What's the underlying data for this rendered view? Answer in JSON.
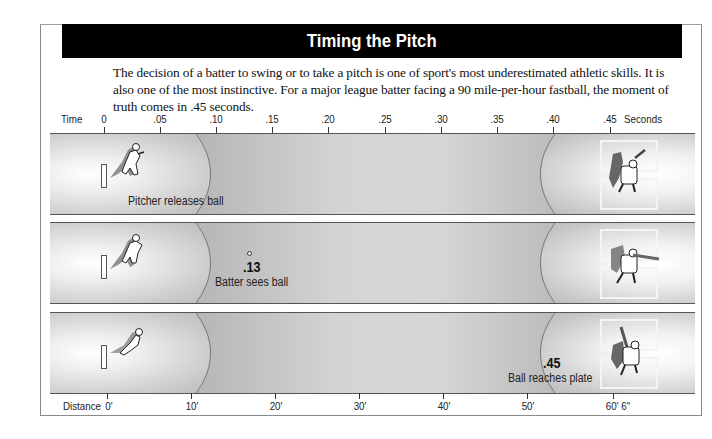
{
  "title": "Timing the Pitch",
  "intro": "The decision of a batter to swing or to take a pitch is one of sport's most underestimated athletic skills. It is also one of the most instinctive. For a major league batter facing a 90 mile-per-hour fastball, the moment of truth comes in .45 seconds.",
  "time_axis": {
    "label": "Time",
    "unit_label": "Seconds",
    "ticks": [
      {
        "label": "0",
        "x": 104
      },
      {
        "label": ".05",
        "x": 160
      },
      {
        "label": ".10",
        "x": 216
      },
      {
        "label": ".15",
        "x": 272
      },
      {
        "label": ".20",
        "x": 328
      },
      {
        "label": ".25",
        "x": 385
      },
      {
        "label": ".30",
        "x": 441
      },
      {
        "label": ".35",
        "x": 497
      },
      {
        "label": ".40",
        "x": 553
      },
      {
        "label": ".45",
        "x": 610
      }
    ]
  },
  "distance_axis": {
    "label": "Distance",
    "ticks": [
      {
        "label": "0'",
        "x": 107
      },
      {
        "label": "10'",
        "x": 191
      },
      {
        "label": "20'",
        "x": 275
      },
      {
        "label": "30'",
        "x": 359
      },
      {
        "label": "40'",
        "x": 443
      },
      {
        "label": "50'",
        "x": 527
      },
      {
        "label": "60' 6\"",
        "x": 613
      }
    ]
  },
  "panels": [
    {
      "caption": "Pitcher releases ball",
      "time": ""
    },
    {
      "caption": "Batter sees ball",
      "time": ".13"
    },
    {
      "caption": "Ball reaches plate",
      "time": ".45"
    }
  ],
  "icons": {
    "pitcher": "pitcher-figure-icon",
    "batter": "batter-figure-icon",
    "ball": "baseball-icon"
  },
  "colors": {
    "title_bar": "#000000",
    "panel_gray": "#b5b5b5",
    "highlight": "#ffffff"
  }
}
